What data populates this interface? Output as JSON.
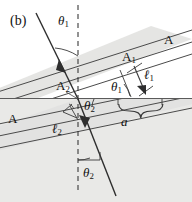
{
  "figure": {
    "panel_label": "(b)",
    "caption_type": "optics-refraction-wavefront-diagram",
    "colors": {
      "background_upper": "#ffffff",
      "background_lower": "#e8e8e6",
      "beam_band": "#dededc",
      "line": "#3a3a3a",
      "text": "#111111"
    }
  },
  "labels": {
    "panel": "(b)",
    "theta1_top": "θ",
    "theta1_top_sub": "1",
    "theta1_mid": "θ",
    "theta1_mid_sub": "1",
    "theta2_mid": "θ",
    "theta2_mid_sub": "2",
    "theta2_bottom": "θ",
    "theta2_bottom_sub": "2",
    "A_right": "A",
    "A_left": "A",
    "A1": "A",
    "A1_sub": "1",
    "A2": "A",
    "A2_sub": "2",
    "ell1": "ℓ",
    "ell1_sub": "1",
    "ell2": "ℓ",
    "ell2_sub": "2",
    "a": "a"
  },
  "geometry": {
    "interface_y": 98,
    "origin": [
      78,
      99
    ],
    "incident_ray": {
      "from": [
        36,
        14
      ],
      "to": [
        78,
        99
      ],
      "arrow_at": [
        60,
        63
      ]
    },
    "refracted_ray": {
      "from": [
        78,
        99
      ],
      "to": [
        116,
        196
      ],
      "arrow_at": [
        89,
        127
      ]
    },
    "normal_dashed": {
      "from": [
        78,
        6
      ],
      "to": [
        78,
        190
      ]
    },
    "a_span": [
      118,
      162
    ],
    "incident_angle_deg": 26,
    "refracted_angle_deg": 21
  }
}
